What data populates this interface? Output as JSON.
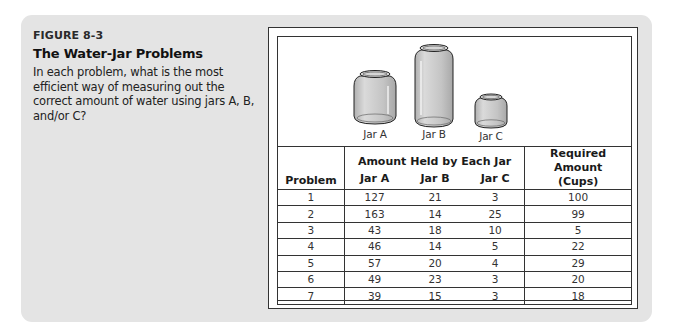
{
  "figure": {
    "label": "FIGURE 8-3",
    "title": "The Water-Jar Problems",
    "description": "In each problem, what is the most efficient way of measuring out the correct amount of water using jars A, B, and/or C?"
  },
  "jars": [
    {
      "name": "jar-a",
      "label": "Jar A"
    },
    {
      "name": "jar-b",
      "label": "Jar B"
    },
    {
      "name": "jar-c",
      "label": "Jar C"
    }
  ],
  "table": {
    "headers": {
      "problem": "Problem",
      "group": "Amount Held by Each Jar",
      "jar_a": "Jar A",
      "jar_b": "Jar B",
      "jar_c": "Jar C",
      "required_line1": "Required Amount",
      "required_line2": "(Cups)"
    },
    "rows": [
      {
        "problem": "1",
        "a": "127",
        "b": "21",
        "c": "3",
        "required": "100"
      },
      {
        "problem": "2",
        "a": "163",
        "b": "14",
        "c": "25",
        "required": "99"
      },
      {
        "problem": "3",
        "a": "43",
        "b": "18",
        "c": "10",
        "required": "5"
      },
      {
        "problem": "4",
        "a": "46",
        "b": "14",
        "c": "5",
        "required": "22"
      },
      {
        "problem": "5",
        "a": "57",
        "b": "20",
        "c": "4",
        "required": "29"
      },
      {
        "problem": "6",
        "a": "49",
        "b": "23",
        "c": "3",
        "required": "20"
      },
      {
        "problem": "7",
        "a": "39",
        "b": "15",
        "c": "3",
        "required": "18"
      }
    ]
  },
  "colors": {
    "panel": "#e4e4e4",
    "border": "#333333",
    "jar_fill": "#c8c8c8"
  }
}
